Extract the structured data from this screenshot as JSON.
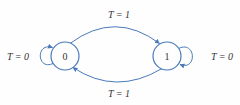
{
  "diagram": {
    "kind": "state-transition-diagram",
    "colors": {
      "line": "#4a7ab8",
      "text": "#333333",
      "background": "#fefefe"
    },
    "states": [
      {
        "label": "0"
      },
      {
        "label": "1"
      }
    ],
    "transitions": [
      {
        "from": "0",
        "to": "1",
        "label": "T = 1",
        "placement": "top"
      },
      {
        "from": "1",
        "to": "0",
        "label": "T = 1",
        "placement": "bottom"
      },
      {
        "from": "0",
        "to": "0",
        "label": "T = 0",
        "placement": "left"
      },
      {
        "from": "1",
        "to": "1",
        "label": "T = 0",
        "placement": "right"
      }
    ]
  }
}
